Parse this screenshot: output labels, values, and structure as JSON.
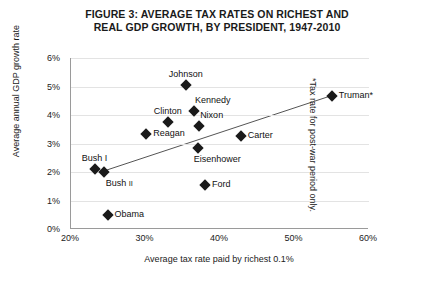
{
  "chart_data": {
    "type": "scatter",
    "title": "FIGURE 3: AVERAGE TAX RATES ON RICHEST AND REAL GDP GROWTH, BY PRESIDENT, 1947-2010",
    "title_line1": "FIGURE 3: AVERAGE TAX RATES ON RICHEST AND",
    "title_line2": "REAL GDP GROWTH, BY PRESIDENT, 1947-2010",
    "xlabel": "Average tax rate paid by richest 0.1%",
    "ylabel": "Average annual GDP growth rate",
    "footnote": "*Tax rate for post-war period only.",
    "xlim": [
      20,
      60
    ],
    "ylim": [
      0,
      6
    ],
    "xticks": [
      "20%",
      "30%",
      "40%",
      "50%",
      "60%"
    ],
    "xtick_values": [
      20,
      30,
      40,
      50,
      60
    ],
    "yticks": [
      "0%",
      "1%",
      "2%",
      "3%",
      "4%",
      "5%",
      "6%"
    ],
    "ytick_values": [
      0,
      1,
      2,
      3,
      4,
      5,
      6
    ],
    "grid": true,
    "legend": "none",
    "marker_shape": "diamond",
    "marker_color": "#1a1a1a",
    "trendline": {
      "label": "linear trend",
      "x_start": 24.0,
      "y_start": 2.0,
      "x_end": 55.2,
      "y_end": 4.7,
      "color": "#555555"
    },
    "points": [
      {
        "name": "Johnson",
        "x": 35.4,
        "y": 5.05,
        "label": "Johnson",
        "label_pos": "top"
      },
      {
        "name": "Kennedy",
        "x": 36.5,
        "y": 4.15,
        "label": "Kennedy",
        "label_pos": "top-right"
      },
      {
        "name": "Truman",
        "x": 55.0,
        "y": 4.65,
        "label": "Truman*",
        "label_pos": "right"
      },
      {
        "name": "Clinton",
        "x": 33.0,
        "y": 3.75,
        "label": "Clinton",
        "label_pos": "top"
      },
      {
        "name": "Nixon",
        "x": 37.2,
        "y": 3.6,
        "label": "Nixon",
        "label_pos": "top-right"
      },
      {
        "name": "Reagan",
        "x": 30.1,
        "y": 3.35,
        "label": "Reagan",
        "label_pos": "right"
      },
      {
        "name": "Carter",
        "x": 42.8,
        "y": 3.25,
        "label": "Carter",
        "label_pos": "right"
      },
      {
        "name": "Eisenhower",
        "x": 37.0,
        "y": 2.85,
        "label": "Eisenhower",
        "label_pos": "bottom"
      },
      {
        "name": "Bush I",
        "x": 23.2,
        "y": 2.1,
        "label": "Bush I",
        "label_pos": "top"
      },
      {
        "name": "Bush II",
        "x": 24.4,
        "y": 2.0,
        "label": "Bush II",
        "label_pos": "bottom-right",
        "label_main": "Bush ",
        "label_sub": "II"
      },
      {
        "name": "Ford",
        "x": 38.0,
        "y": 1.55,
        "label": "Ford",
        "label_pos": "right"
      },
      {
        "name": "Obama",
        "x": 24.9,
        "y": 0.5,
        "label": "Obama",
        "label_pos": "right"
      }
    ]
  }
}
